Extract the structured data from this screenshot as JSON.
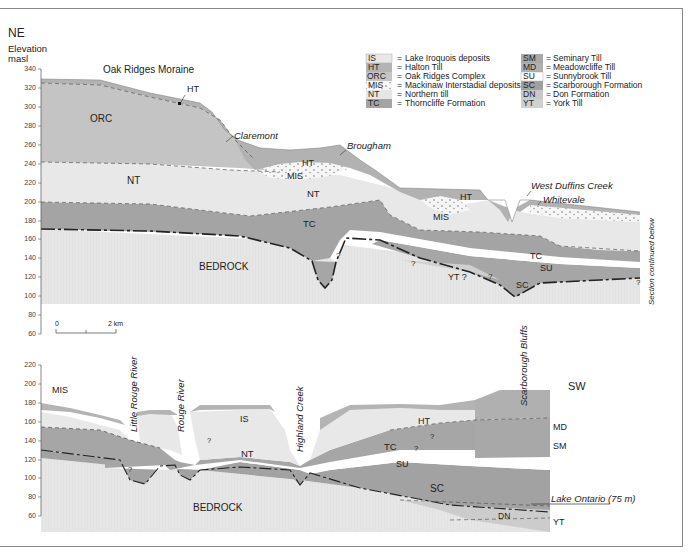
{
  "direction": {
    "start": "NE",
    "end": "SW"
  },
  "axis": {
    "label_line1": "Elevation",
    "label_line2": "masl",
    "upper_ticks": [
      "340",
      "320",
      "300",
      "280",
      "260",
      "240",
      "220",
      "200",
      "180",
      "160",
      "140",
      "120",
      "100",
      "80",
      "60"
    ],
    "lower_ticks": [
      "220",
      "200",
      "180",
      "160",
      "140",
      "120",
      "100",
      "80",
      "60"
    ]
  },
  "scale_bar": {
    "start": "0",
    "end": "2 km"
  },
  "legend": {
    "left": [
      {
        "code": "IS",
        "name": "Lake Iroquois deposits",
        "color": "#e8e8e8"
      },
      {
        "code": "HT",
        "name": "Halton Till",
        "color": "#b4b4b4"
      },
      {
        "code": "ORC",
        "name": "Oak Ridges Complex",
        "color": "#c4c4c4"
      },
      {
        "code": "MIS",
        "name": "Mackinaw Interstadial deposits",
        "color": "#f4f4f4"
      },
      {
        "code": "NT",
        "name": "Northern till",
        "color": "#e6e6e6"
      },
      {
        "code": "TC",
        "name": "Thorncliffe Formation",
        "color": "#a4a4a4"
      }
    ],
    "right": [
      {
        "code": "SM",
        "name": "Seminary Till",
        "color": "#a8a8a8"
      },
      {
        "code": "MD",
        "name": "Meadowcliffe Till",
        "color": "#b0b0b0"
      },
      {
        "code": "SU",
        "name": "Sunnybrook Till",
        "color": "#ffffff"
      },
      {
        "code": "SC",
        "name": "Scarborough Formation",
        "color": "#a0a0a0"
      },
      {
        "code": "DN",
        "name": "Don Formation",
        "color": "#c8c8c8"
      },
      {
        "code": "YT",
        "name": "York Till",
        "color": "#d0d0d0"
      }
    ],
    "separator": "="
  },
  "upper_section": {
    "title": "Oak Ridges Moraine",
    "unit_labels": {
      "HT_top": "HT",
      "ORC": "ORC",
      "NT_left": "NT",
      "TC_left": "TC",
      "BEDROCK": "BEDROCK",
      "HT_mid": "HT",
      "MIS_mid": "MIS",
      "NT_mid": "NT",
      "HT_right": "HT",
      "MIS_right": "MIS",
      "TC_right": "TC",
      "SU": "SU",
      "YT": "YT ?",
      "SC": "SC"
    },
    "place_labels": [
      "Claremont",
      "Brougham",
      "West Duffins Creek",
      "Whitevale"
    ],
    "question_marks": [
      "?",
      "?",
      "?",
      "?"
    ],
    "continuation_note": "Section continued below"
  },
  "lower_section": {
    "unit_labels": {
      "MIS": "MIS",
      "IS": "IS",
      "NT": "NT",
      "HT": "HT",
      "TC": "TC",
      "SU": "SU",
      "SC": "SC",
      "BEDROCK": "BEDROCK",
      "MD": "MD",
      "SM": "SM",
      "DN": "DN",
      "YT": "YT"
    },
    "place_labels": [
      "Little Rouge River",
      "Rouge River",
      "Highland Creek",
      "Scarborough Bluffs"
    ],
    "lake_label": "Lake Ontario (75 m)",
    "question_marks": [
      "?",
      "?",
      "?",
      "?"
    ]
  },
  "colors": {
    "bedrock": "#e4e4e4",
    "frame": "#888888",
    "contact_line": "#222222"
  }
}
